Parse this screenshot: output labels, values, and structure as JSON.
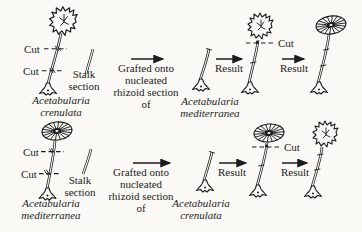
{
  "palette": {
    "background": "#faf9f5",
    "ink": "#1c1c1c"
  },
  "rows": [
    {
      "cut_labels": [
        "Cut",
        "Cut"
      ],
      "stalk_section_label": {
        "lines": [
          "Stalk",
          "section"
        ]
      },
      "donor_species": {
        "lines": [
          "Acetabularia",
          "crenulata"
        ]
      },
      "graft_caption": {
        "lines": [
          "Grafted onto",
          "nucleated",
          "rhizoid section",
          "of"
        ]
      },
      "host_species": {
        "lines": [
          "Acetabularia",
          "mediterranea"
        ]
      },
      "result_labels": [
        "Result",
        "Result"
      ],
      "result_cut_label": "Cut"
    },
    {
      "cut_labels": [
        "Cut",
        "Cut"
      ],
      "stalk_section_label": {
        "lines": [
          "Stalk",
          "section"
        ]
      },
      "donor_species": {
        "lines": [
          "Acetabularia",
          "mediterranea"
        ]
      },
      "graft_caption": {
        "lines": [
          "Grafted onto",
          "nucleated",
          "rhizoid section",
          "of"
        ]
      },
      "host_species": {
        "lines": [
          "Acetabularia",
          "crenulata"
        ]
      },
      "result_labels": [
        "Result",
        "Result"
      ],
      "result_cut_label": "Cut"
    }
  ]
}
